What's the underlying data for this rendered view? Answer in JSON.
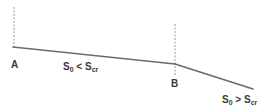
{
  "diagram": {
    "type": "channel-longitudinal-profile",
    "colors": {
      "bed_line": "#6b6b6b",
      "section_line": "#9a9a9a",
      "text": "#3a3a3a",
      "background": "#ffffff"
    },
    "points": {
      "A": {
        "label": "A",
        "x": 14,
        "y": 47
      },
      "B": {
        "label": "B",
        "x": 175,
        "y": 64
      }
    },
    "end_point": {
      "x": 253,
      "y": 89
    },
    "sections": [
      {
        "name": "A",
        "x": 14,
        "y_top": 7,
        "y_bottom": 49
      },
      {
        "name": "B",
        "x": 175,
        "y_top": 24,
        "y_bottom": 75
      }
    ],
    "reaches": [
      {
        "name": "mild",
        "slope_main": "S",
        "slope_main_sub": "0",
        "relation": " < ",
        "slope_ref": "S",
        "slope_ref_sub": "cr"
      },
      {
        "name": "steep",
        "slope_main": "S",
        "slope_main_sub": "0",
        "relation": " > ",
        "slope_ref": "S",
        "slope_ref_sub": "cr"
      }
    ]
  }
}
